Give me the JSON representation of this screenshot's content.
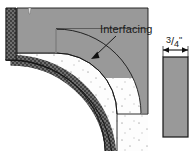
{
  "figure": {
    "labels": {
      "interfacing": "Interfacing",
      "dimension_numerator": "3",
      "dimension_slash": "/",
      "dimension_denominator": "4",
      "dimension_unit": "\"",
      "dimension_full": "3/4\""
    },
    "colors": {
      "interfacing_gray": "#999999",
      "fabric_white": "#fdfdfd",
      "edge_dark": "#3b3b3b",
      "outline_black": "#1a1a1a",
      "dot_gray": "#b4b4b4",
      "background": "#ffffff",
      "strip_gray": "#999999"
    },
    "parts": [
      {
        "name": "curved-fabric-panel",
        "description": "quarter-round fabric panel with speckled white fill"
      },
      {
        "name": "interfacing-band",
        "description": "gray band following the inner curved edge and top edge"
      },
      {
        "name": "outer-edge-band",
        "description": "dark crosshatched textured band along outer curve"
      },
      {
        "name": "notch-mark",
        "description": "small white notch at top of interfacing band"
      },
      {
        "name": "leader-arrow",
        "description": "arrow from Interfacing label pointing to gray band"
      },
      {
        "name": "bias-strip",
        "description": "solid gray vertical rectangle representing cut strip"
      },
      {
        "name": "dimension-arrow",
        "description": "double-headed width arrow above bias strip"
      }
    ]
  }
}
